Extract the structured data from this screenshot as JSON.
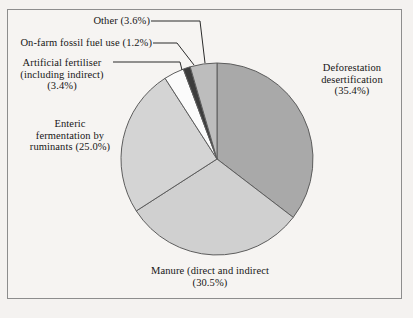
{
  "chart_data": {
    "type": "pie",
    "title": "",
    "subtitle": "",
    "xlabel": "",
    "ylabel": "",
    "legend_position": "callout-labels",
    "grid": false,
    "units": "percent",
    "start_angle_deg": 0,
    "direction": "clockwise",
    "categories": [
      "Deforestation desertification",
      "Manure (direct and indirect",
      "Enteric fermentation by ruminants",
      "Artificial fertiliser (including indirect)",
      "On-farm fossil fuel use",
      "Other"
    ],
    "values": [
      35.4,
      30.5,
      25.0,
      3.4,
      1.2,
      3.6
    ],
    "slices": [
      {
        "name": "deforestation",
        "label": "Deforestation\ndesertification\n(35.4%)",
        "value": 35.4,
        "value_text": "(35.4%)",
        "color": "#a9a9a9",
        "start_deg": 0.0,
        "end_deg": 127.44
      },
      {
        "name": "manure",
        "label": "Manure (direct and indirect\n(30.5%)",
        "value": 30.5,
        "value_text": "(30.5%)",
        "color": "#d0d0d0",
        "start_deg": 127.44,
        "end_deg": 237.24
      },
      {
        "name": "enteric-fermentation",
        "label": "Enteric\nfermentation by\nruminants (25.0%)",
        "value": 25.0,
        "value_text": "(25.0%)",
        "color": "#d4d4d4",
        "start_deg": 237.24,
        "end_deg": 327.24
      },
      {
        "name": "artificial-fertiliser",
        "label": "Artificial fertiliser\n(including indirect)\n(3.4%)",
        "value": 3.4,
        "value_text": "(3.4%)",
        "color": "#fbfbfb",
        "start_deg": 327.24,
        "end_deg": 339.48
      },
      {
        "name": "on-farm-fossil-fuel",
        "label": "On-farm fossil fuel use (1.2%)",
        "value": 1.2,
        "value_text": "(1.2%)",
        "color": "#3c3c3c",
        "start_deg": 339.48,
        "end_deg": 343.8
      },
      {
        "name": "other",
        "label": "Other (3.6%)",
        "value": 3.6,
        "value_text": "(3.6%)",
        "color": "#bdbdbd",
        "start_deg": 343.8,
        "end_deg": 360.0
      }
    ]
  },
  "labels": {
    "other": "Other (3.6%)",
    "fossil_fuel": "On-farm fossil fuel use (1.2%)",
    "fertiliser": "Artificial fertiliser\n(including indirect)\n(3.4%)",
    "enteric": "Enteric\nfermentation by\nruminants (25.0%)",
    "deforestation": "Deforestation\ndesertification\n(35.4%)",
    "manure": "Manure (direct and indirect\n(30.5%)"
  },
  "style": {
    "page_background": "#f4f2f0",
    "frame_background": "#f6f4f2",
    "frame_border": "#8d8d8d",
    "slice_outline": "#5d5d5d",
    "text_color": "#161616",
    "leader_line_color": "#2b2b2b"
  },
  "geometry": {
    "center_x": 217,
    "center_y": 159,
    "radius_x": 96,
    "radius_y": 96
  }
}
